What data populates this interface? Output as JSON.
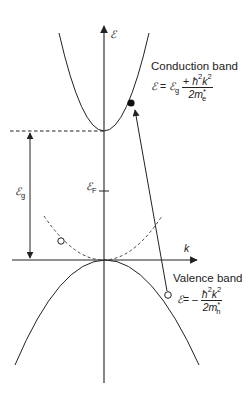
{
  "diagram": {
    "axes": {
      "vertical_label": "ℰ",
      "horizontal_label": "k"
    },
    "conduction_band": {
      "title": "Conduction band",
      "eq_lhs": "ℰ",
      "eq_equals": "=",
      "eq_eg": "ℰ",
      "eq_eg_sub": "g",
      "eq_plus": "+",
      "eq_numerator": "ħ",
      "eq_num_sup1": "2",
      "eq_num_k": "k",
      "eq_num_sup2": "2",
      "eq_denominator": "2m",
      "eq_den_star": "*",
      "eq_den_sub": "e"
    },
    "valence_band": {
      "title": "Valence band",
      "eq_lhs": "ℰ",
      "eq_equals": "=",
      "eq_minus": "–",
      "eq_numerator": "ħ",
      "eq_num_sup1": "2",
      "eq_num_k": "k",
      "eq_num_sup2": "2",
      "eq_denominator": "2m",
      "eq_den_star": "*",
      "eq_den_sub": "h"
    },
    "gap_label": "ℰ",
    "gap_sub": "g",
    "fermi_label": "ℰ",
    "fermi_sub": "F",
    "colors": {
      "line": "#222222",
      "background": "#ffffff"
    }
  }
}
